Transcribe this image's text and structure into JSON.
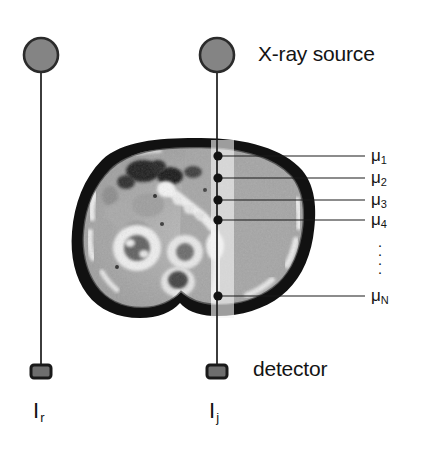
{
  "figure": {
    "background_color": "#ffffff",
    "width": 425,
    "height": 449
  },
  "annotations": {
    "xray_source_label": "X-ray source",
    "detector_label": "detector"
  },
  "rays": [
    {
      "id": "reference-ray",
      "name": "reference ray",
      "intensity_symbol": "I",
      "intensity_subscript": "r",
      "source_x": 41,
      "source_y": 55,
      "source_radius": 17,
      "detector_x": 41,
      "detector_y": 372,
      "passes_through_object": false
    },
    {
      "id": "object-ray",
      "name": "object ray",
      "intensity_symbol": "I",
      "intensity_subscript": "j",
      "source_x": 217,
      "source_y": 55,
      "source_radius": 17,
      "detector_x": 217,
      "detector_y": 372,
      "passes_through_object": true
    }
  ],
  "beam": {
    "name": "x-ray beam band",
    "left": 211,
    "right": 234,
    "top": 140,
    "bottom": 318,
    "color": "#f2f2f2",
    "opacity": 0.62
  },
  "voxels": [
    {
      "label": "μ",
      "subscript": "1",
      "dot_x": 218,
      "dot_y": 156,
      "leader_end_x": 365,
      "label_x": 371,
      "label_y": 148
    },
    {
      "label": "μ",
      "subscript": "2",
      "dot_x": 218,
      "dot_y": 178,
      "leader_end_x": 365,
      "label_x": 371,
      "label_y": 170
    },
    {
      "label": "μ",
      "subscript": "3",
      "dot_x": 218,
      "dot_y": 200,
      "leader_end_x": 365,
      "label_x": 371,
      "label_y": 192
    },
    {
      "label": "μ",
      "subscript": "4",
      "dot_x": 218,
      "dot_y": 220,
      "leader_end_x": 365,
      "label_x": 371,
      "label_y": 212
    },
    {
      "label": "μ",
      "subscript": "N",
      "dot_x": 218,
      "dot_y": 296,
      "leader_end_x": 365,
      "label_x": 371,
      "label_y": 288
    }
  ],
  "ellipsis": {
    "name": "vertical-ellipsis",
    "dots": [
      "·",
      "·",
      "·",
      "·"
    ]
  },
  "ct_slice": {
    "name": "abdominal CT cross-section",
    "description": "grayscale axial abdominal CT slice",
    "left": 73,
    "top": 138,
    "width": 243,
    "height": 182
  },
  "colors": {
    "source_fill": "#808080",
    "source_stroke": "#2b2b2b",
    "detector_fill": "#6e6e6e",
    "detector_stroke": "#1e1e1e",
    "line": "#1a1a1a",
    "text": "#141414",
    "beam": "#f2f2f2"
  }
}
